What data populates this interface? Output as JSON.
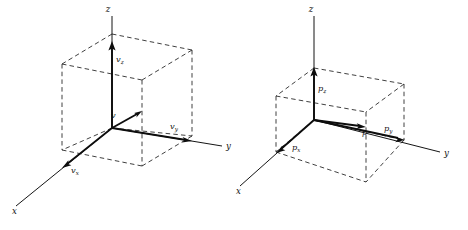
{
  "figure": {
    "type": "vector-decomposition-diagram-pair",
    "background_color": "#ffffff",
    "ink_color": "#111111",
    "panels": [
      {
        "id": "left",
        "name": "velocity-vector-panel",
        "vector_symbol": "v",
        "axes": [
          {
            "name": "x",
            "label": "x"
          },
          {
            "name": "y",
            "label": "y"
          },
          {
            "name": "z",
            "label": "z"
          }
        ],
        "labels": {
          "resultant": "v",
          "component_x": "v",
          "component_x_sub": "x",
          "component_y": "v",
          "component_y_sub": "y",
          "component_z": "v",
          "component_z_sub": "z"
        }
      },
      {
        "id": "right",
        "name": "momentum-vector-panel",
        "vector_symbol": "p",
        "axes": [
          {
            "name": "x",
            "label": "x"
          },
          {
            "name": "y",
            "label": "y"
          },
          {
            "name": "z",
            "label": "z"
          }
        ],
        "labels": {
          "resultant": "p",
          "component_x": "p",
          "component_x_sub": "x",
          "component_y": "p",
          "component_y_sub": "y",
          "component_z": "p",
          "component_z_sub": "z"
        }
      }
    ]
  }
}
